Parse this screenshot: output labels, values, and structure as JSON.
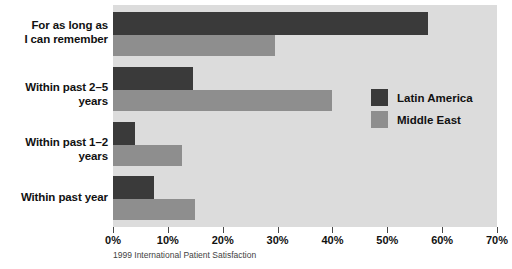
{
  "chart_data": {
    "type": "bar",
    "orientation": "horizontal",
    "title": "",
    "subtitle": "",
    "caption": "1999 International Patient Satisfaction",
    "categories": [
      "For as long as\nI can remember",
      "Within past 2–5 years",
      "Within past 1–2 years",
      "Within past year"
    ],
    "categories_display": [
      [
        "For as long as",
        "I can remember"
      ],
      [
        "Within past 2–5 years"
      ],
      [
        "Within past 1–2 years"
      ],
      [
        "Within past year"
      ]
    ],
    "series": [
      {
        "name": "Latin America",
        "color": "#3a3a3a",
        "values": [
          57.5,
          14.5,
          4,
          7.5
        ]
      },
      {
        "name": "Middle East",
        "color": "#8e8e8e",
        "values": [
          29.5,
          40,
          12.5,
          15
        ]
      }
    ],
    "xlabel": "",
    "ylabel": "",
    "xlim": [
      0,
      70
    ],
    "xticks": [
      0,
      10,
      20,
      30,
      40,
      50,
      60,
      70
    ],
    "xtick_labels": [
      "0%",
      "10%",
      "20%",
      "30%",
      "40%",
      "50%",
      "60%",
      "70%"
    ],
    "grid": false,
    "legend_position": "inside-right-middle",
    "plot_background": "#dcdcdc",
    "page_background": "#ffffff"
  },
  "legend": {
    "items": [
      {
        "label": "Latin America",
        "color": "#3a3a3a"
      },
      {
        "label": "Middle East",
        "color": "#8e8e8e"
      }
    ]
  }
}
